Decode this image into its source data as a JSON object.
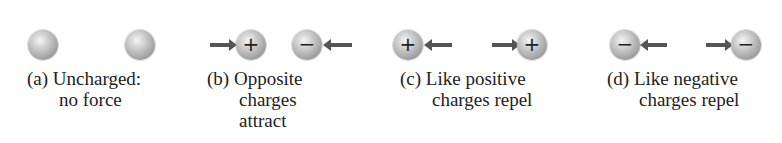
{
  "figure": {
    "panels": [
      {
        "id": "a",
        "letter": "(a)",
        "lines": [
          "Uncharged:",
          "no force"
        ],
        "left_charge": "",
        "right_charge": "",
        "force": "none"
      },
      {
        "id": "b",
        "letter": "(b)",
        "lines": [
          "Opposite",
          "charges",
          "attract"
        ],
        "left_charge": "+",
        "right_charge": "−",
        "force": "attract"
      },
      {
        "id": "c",
        "letter": "(c)",
        "lines": [
          "Like positive",
          "charges repel"
        ],
        "left_charge": "+",
        "right_charge": "+",
        "force": "repel"
      },
      {
        "id": "d",
        "letter": "(d)",
        "lines": [
          "Like negative",
          "charges repel"
        ],
        "left_charge": "−",
        "right_charge": "−",
        "force": "repel"
      }
    ]
  },
  "colors": {
    "arrow": "#555555",
    "sphere": "#b0b0b0",
    "text": "#222222"
  }
}
